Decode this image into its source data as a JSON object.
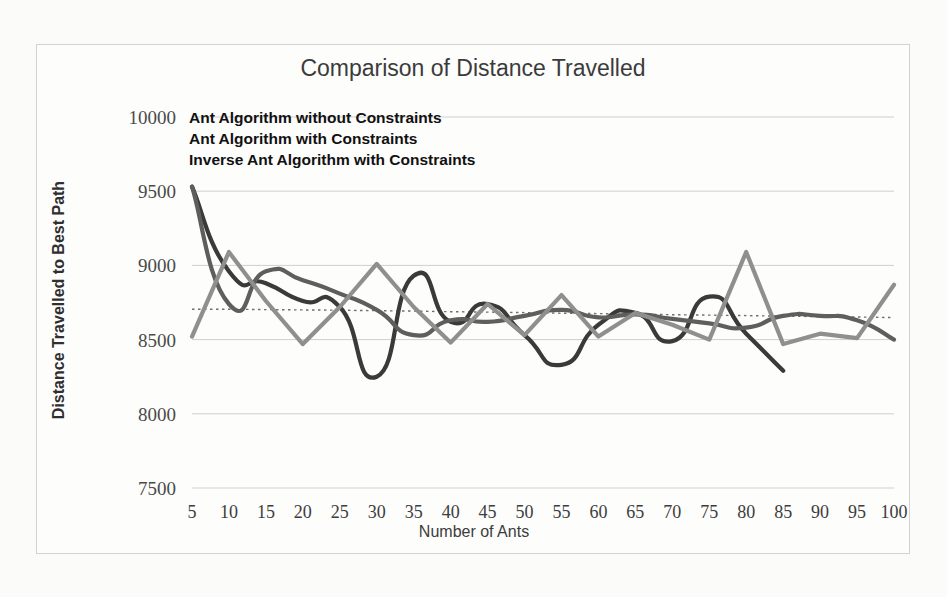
{
  "page": {
    "background_color": "#fbfbfa",
    "frame_color": "#d2d2d2"
  },
  "chart_data": {
    "type": "line",
    "title": "Comparison of Distance Travelled",
    "xlabel": "Number of Ants",
    "ylabel": "Distance Travelled to Best Path",
    "xlim": [
      5,
      100
    ],
    "ylim": [
      7500,
      10000
    ],
    "ytick_labels": [
      "10000",
      "9500",
      "9000",
      "8500",
      "8000",
      "7500"
    ],
    "ytick_values": [
      10000,
      9500,
      9000,
      8500,
      8000,
      7500
    ],
    "xtick_labels": [
      "5",
      "10",
      "15",
      "20",
      "25",
      "30",
      "35",
      "40",
      "45",
      "50",
      "55",
      "60",
      "65",
      "70",
      "75",
      "80",
      "85",
      "90",
      "95",
      "100"
    ],
    "x": [
      5,
      10,
      15,
      20,
      25,
      30,
      35,
      40,
      45,
      50,
      55,
      60,
      65,
      70,
      75,
      80,
      85,
      90,
      95,
      100
    ],
    "grid": "horizontal",
    "legend_position": "inside-top-left",
    "trendline": {
      "label": "moving-average trendline",
      "style": "dotted",
      "color": "#6e6e6e",
      "values": [
        8705,
        8705,
        8702,
        8700,
        8698,
        8695,
        8692,
        8688,
        8685,
        8682,
        8678,
        8675,
        8672,
        8668,
        8665,
        8662,
        8658,
        8655,
        8652,
        8648
      ]
    },
    "series": [
      {
        "name": "Ant Algorithm without Constraints",
        "color": "#3a3a3a",
        "smooth": true,
        "values": [
          9530,
          8960,
          8880,
          8760,
          8720,
          8250,
          8930,
          8620,
          8740,
          8530,
          8330,
          8600,
          8680,
          8490,
          8790,
          8540,
          8290,
          null,
          null,
          null
        ]
      },
      {
        "name": "Ant Algorithm with Constraints",
        "color": "#5e5e5e",
        "smooth": true,
        "values": [
          9530,
          8740,
          8960,
          8900,
          8810,
          8700,
          8530,
          8630,
          8620,
          8660,
          8700,
          8650,
          8670,
          8640,
          8610,
          8580,
          8660,
          8660,
          8630,
          8500
        ]
      },
      {
        "name": "Inverse Ant Algorithm with Constraints",
        "color": "#8f8f8f",
        "smooth": false,
        "values": [
          8520,
          9090,
          8760,
          8470,
          8720,
          9010,
          8720,
          8480,
          8740,
          8530,
          8800,
          8520,
          8680,
          8600,
          8500,
          9090,
          8470,
          8540,
          8510,
          8870
        ]
      }
    ],
    "legend_entries": [
      "Ant Algorithm without Constraints",
      "Ant Algorithm with Constraints",
      "Inverse Ant Algorithm with Constraints"
    ]
  }
}
